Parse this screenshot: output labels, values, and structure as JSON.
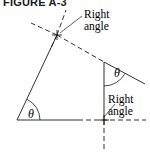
{
  "figure": {
    "title": "FIGURE A-3",
    "caption_labels": {
      "right_angle_top": "Right angle",
      "right_angle_top_line1": "Right",
      "right_angle_top_line2": "angle",
      "right_angle_bottom_line1": "Right",
      "right_angle_bottom_line2": "angle",
      "theta_left": "θ",
      "theta_right": "θ"
    },
    "colors": {
      "stroke": "#1a1a1a",
      "text": "#000000",
      "background": "#ffffff"
    },
    "geometry": {
      "vertex_bottom_left": [
        17,
        120
      ],
      "vertex_crossing_top": [
        57,
        35
      ],
      "vertex_cross_bottom": [
        104,
        120
      ],
      "vertex_theta_right": [
        104,
        62
      ],
      "baseline_solid_end": [
        78,
        120
      ],
      "baseline_dashed_end": [
        146,
        120
      ],
      "slant_solid_end": [
        145,
        84
      ],
      "vertical_dashed_end": [
        104,
        150
      ],
      "dashed_upleft_end": [
        31,
        23
      ],
      "dashed_upright_end": [
        66,
        10
      ],
      "leader_top_end": [
        82,
        16
      ],
      "leader_bottom_end": [
        107,
        101
      ]
    }
  }
}
